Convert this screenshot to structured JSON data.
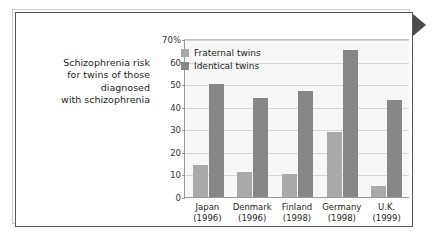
{
  "caption": {
    "lines": [
      "Schizophrenia risk",
      "for twins of those",
      "diagnosed",
      "with schizophrenia"
    ]
  },
  "colors": {
    "fraternal": "#a9a9a9",
    "identical": "#878787",
    "plot_background": "#f7f7f7",
    "gridline": "#d6d6d6",
    "axis": "#9a9a9a",
    "frame_inner": "#58595b",
    "frame_outer": "#c9c9c9",
    "pointer": "#4a4a4c",
    "text": "#231f20"
  },
  "chart_data": {
    "type": "bar",
    "title": "",
    "xlabel": "",
    "ylabel": "",
    "ylim": [
      0,
      70
    ],
    "yticks": [
      0,
      10,
      20,
      30,
      40,
      50,
      60,
      70
    ],
    "ytick_labels": [
      "0",
      "10",
      "20",
      "30",
      "40",
      "50",
      "60",
      "70%"
    ],
    "grid": true,
    "legend_position": "top-left",
    "categories": [
      "Japan\n(1996)",
      "Denmark\n(1996)",
      "Finland\n(1998)",
      "Germany\n(1998)",
      "U.K.\n(1999)"
    ],
    "category_rows": [
      {
        "name": "Japan",
        "year": "(1996)"
      },
      {
        "name": "Denmark",
        "year": "(1996)"
      },
      {
        "name": "Finland",
        "year": "(1998)"
      },
      {
        "name": "Germany",
        "year": "(1998)"
      },
      {
        "name": "U.K.",
        "year": "(1999)"
      }
    ],
    "series": [
      {
        "name": "Fraternal twins",
        "color": "#a9a9a9",
        "values": [
          14,
          11,
          10,
          29,
          5
        ]
      },
      {
        "name": "Identical twins",
        "color": "#878787",
        "values": [
          50,
          44,
          47,
          65,
          43
        ]
      }
    ]
  },
  "legend": [
    {
      "label": "Fraternal twins",
      "key": "fraternal"
    },
    {
      "label": "Identical twins",
      "key": "identical"
    }
  ],
  "pointer": {
    "icon": "triangle-right-icon"
  }
}
